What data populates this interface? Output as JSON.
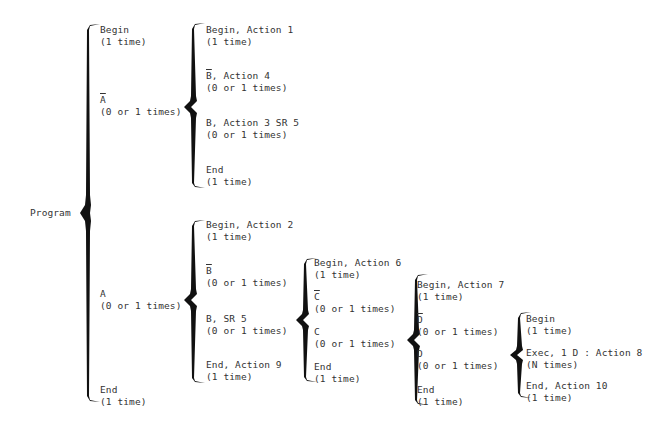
{
  "root": {
    "label": "Program"
  },
  "level1": [
    {
      "name": "Begin",
      "negated": false,
      "count": "(1 time)"
    },
    {
      "name": "A",
      "negated": true,
      "count": "(0 or 1 times)"
    },
    {
      "name": "A",
      "negated": false,
      "count": "(0 or 1 times)"
    },
    {
      "name": "End",
      "negated": false,
      "count": "(1 time)"
    }
  ],
  "not_a_branch": [
    {
      "name": "Begin, Action 1",
      "negated": false,
      "count": "(1 time)"
    },
    {
      "name": "B",
      "suffix": ", Action 4",
      "negated": true,
      "count": "(0 or 1 times)"
    },
    {
      "name": "B, Action 3 SR 5",
      "negated": false,
      "count": "(0 or 1 times)"
    },
    {
      "name": "End",
      "negated": false,
      "count": "(1 time)"
    }
  ],
  "a_branch": [
    {
      "name": "Begin, Action 2",
      "negated": false,
      "count": "(1 time)"
    },
    {
      "name": "B",
      "negated": true,
      "count": "(0 or 1 times)"
    },
    {
      "name": "B, SR 5",
      "negated": false,
      "count": "(0 or 1 times)"
    },
    {
      "name": "End, Action 9",
      "negated": false,
      "count": "(1 time)"
    }
  ],
  "b_sr5_branch": [
    {
      "name": "Begin, Action 6",
      "negated": false,
      "count": "(1 time)"
    },
    {
      "name": "C",
      "negated": true,
      "count": "(0 or 1 times)"
    },
    {
      "name": "C",
      "negated": false,
      "count": "(0 or 1 times)"
    },
    {
      "name": "End",
      "negated": false,
      "count": "(1 time)"
    }
  ],
  "c_branch": [
    {
      "name": "Begin, Action 7",
      "negated": false,
      "count": "(1 time)"
    },
    {
      "name": "D",
      "negated": true,
      "count": "(0 or 1 times)"
    },
    {
      "name": "D",
      "negated": false,
      "count": "(0 or 1 times)"
    },
    {
      "name": "End",
      "negated": false,
      "count": "(1 time)"
    }
  ],
  "d_branch": [
    {
      "name": "Begin",
      "negated": false,
      "count": "(1 time)"
    },
    {
      "name": "Exec, 1 D : Action 8",
      "negated": false,
      "count": "(N times)"
    },
    {
      "name": "End, Action 10",
      "negated": false,
      "count": "(1 time)"
    }
  ],
  "colors": {
    "ink": "#111111",
    "text": "#333333",
    "background": "#ffffff"
  }
}
